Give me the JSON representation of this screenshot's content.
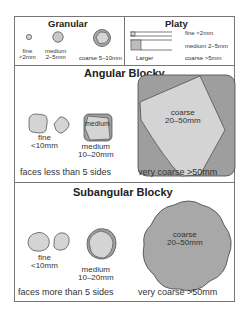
{
  "colors": {
    "fill_light": "#d4d4d4",
    "fill_dark": "#9e9e9e",
    "fill_mid": "#b0b0b0",
    "stroke": "#444444",
    "border": "#777777"
  },
  "granular": {
    "title": "Granular",
    "items": [
      {
        "label": "fine",
        "range": "<2mm"
      },
      {
        "label": "medium",
        "range": "2–5mm"
      },
      {
        "label": "coarse 5–10mm"
      }
    ]
  },
  "platy": {
    "title": "Platy",
    "items": [
      {
        "label": "fine  <2mm"
      },
      {
        "label": "medium 2–5mm"
      },
      {
        "label": "coarse  >5mm"
      }
    ],
    "larger_label": "Larger"
  },
  "angular_blocky": {
    "title": "Angular Blocky",
    "fine": {
      "label": "fine",
      "range": "<10mm"
    },
    "medium": {
      "inner": "medium",
      "label": "medium",
      "range": "10–20mm"
    },
    "coarse": {
      "label": "coarse",
      "range": "20–50mm"
    },
    "faces_note": "faces less than 5 sides",
    "very_coarse": "very coarse  >50mm"
  },
  "subangular_blocky": {
    "title": "Subangular Blocky",
    "fine": {
      "label": "fine",
      "range": "<10mm"
    },
    "medium": {
      "label": "medium",
      "range": "10–20mm"
    },
    "coarse": {
      "label": "coarse",
      "range": "20–50mm"
    },
    "faces_note": "faces more than 5 sides",
    "very_coarse": "very coarse  >50mm"
  }
}
